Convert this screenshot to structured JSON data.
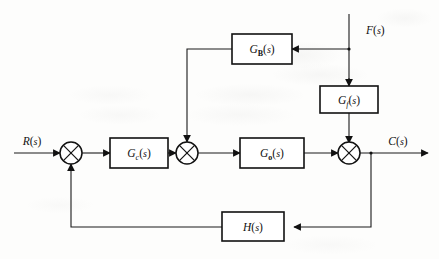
{
  "diagram": {
    "type": "control-system-block-diagram",
    "signals": {
      "reference_input": "R(s)",
      "disturbance_input": "F(s)",
      "output": "C(s)"
    },
    "blocks": [
      {
        "id": "gb",
        "label_main": "G",
        "label_sub": "B",
        "label_arg": "(s)",
        "full": "G_B(s)",
        "role": "feedforward-compensator"
      },
      {
        "id": "gf",
        "label_main": "G",
        "label_sub": "f",
        "label_arg": "(s)",
        "full": "G_f(s)",
        "role": "disturbance-transfer"
      },
      {
        "id": "gc",
        "label_main": "G",
        "label_sub": "c",
        "label_arg": "(s)",
        "full": "G_c(s)",
        "role": "controller"
      },
      {
        "id": "go",
        "label_main": "G",
        "label_sub": "o",
        "label_arg": "(s)",
        "full": "G_o(s)",
        "role": "plant"
      },
      {
        "id": "h",
        "label_main": "H",
        "label_sub": "",
        "label_arg": "(s)",
        "full": "H(s)",
        "role": "feedback-element"
      }
    ],
    "summing_junctions": [
      {
        "id": "sum1",
        "symbol": "cross-circle",
        "inputs": [
          "R(s)",
          "feedback H(s)"
        ]
      },
      {
        "id": "sum2",
        "symbol": "cross-circle",
        "inputs": [
          "G_c(s) output",
          "G_B(s) output"
        ]
      },
      {
        "id": "sum3",
        "symbol": "cross-circle",
        "inputs": [
          "G_o(s) output",
          "G_f(s) output"
        ]
      }
    ],
    "colors": {
      "ink": "#111111",
      "wire": "#1a1a1a",
      "paper": "#fdfdfc",
      "block_fill": "#ffffff"
    }
  }
}
